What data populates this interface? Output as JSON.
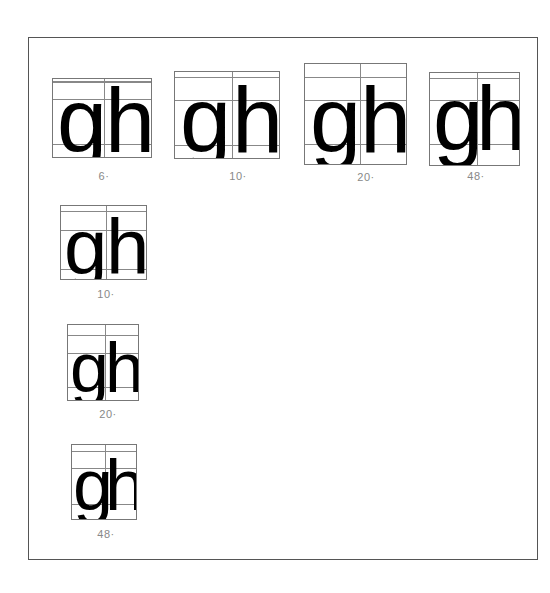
{
  "frame": {
    "border_color": "#555555"
  },
  "specimens": [
    {
      "glyphs": "gh",
      "g": "g",
      "h": "h",
      "caption": "6·"
    },
    {
      "glyphs": "gh",
      "g": "g",
      "h": "h",
      "caption": "10·"
    },
    {
      "glyphs": "gh",
      "g": "g",
      "h": "h",
      "caption": "20·"
    },
    {
      "glyphs": "gh",
      "g": "g",
      "h": "h",
      "caption": "48·"
    },
    {
      "glyphs": "gh",
      "g": "g",
      "h": "h",
      "caption": "10·"
    },
    {
      "glyphs": "gh",
      "g": "g",
      "h": "h",
      "caption": "20·"
    },
    {
      "glyphs": "gh",
      "g": "g",
      "h": "h",
      "caption": "48·"
    }
  ],
  "colors": {
    "ink": "#000000",
    "grid": "#888888",
    "caption": "#888888"
  }
}
